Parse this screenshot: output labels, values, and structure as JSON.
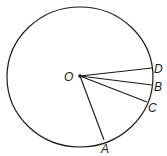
{
  "diagram": {
    "type": "circle-with-radii",
    "stroke_color": "#1a1a1a",
    "background": "#ffffff",
    "circle": {
      "cx": 80,
      "cy": 77,
      "rx": 73,
      "ry": 70
    },
    "center": {
      "label": "O",
      "x": 80,
      "y": 76,
      "label_x": 64,
      "label_y": 81
    },
    "points": [
      {
        "label": "D",
        "x": 152,
        "y": 68,
        "label_x": 154,
        "label_y": 73
      },
      {
        "label": "B",
        "x": 152,
        "y": 85,
        "label_x": 154,
        "label_y": 91
      },
      {
        "label": "C",
        "x": 147,
        "y": 102,
        "label_x": 148,
        "label_y": 112
      },
      {
        "label": "A",
        "x": 104,
        "y": 140,
        "label_x": 101,
        "label_y": 153
      }
    ],
    "segments": [
      "OD",
      "OB",
      "OC",
      "OA"
    ]
  }
}
